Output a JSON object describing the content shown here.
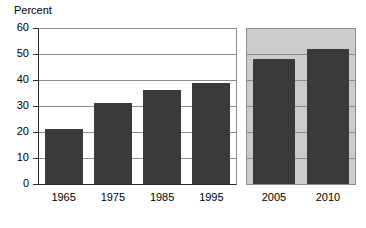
{
  "chart_data": {
    "type": "bar",
    "title": "",
    "xlabel": "",
    "ylabel": "Percent",
    "ylim": [
      0,
      60
    ],
    "yticks": [
      0,
      10,
      20,
      30,
      40,
      50,
      60
    ],
    "grid": true,
    "legend": null,
    "categories": [
      "1965",
      "1975",
      "1985",
      "1995",
      "2005",
      "2010"
    ],
    "values": [
      21,
      31,
      36,
      39,
      48,
      52
    ],
    "panels": [
      {
        "name": "historical-panel",
        "background": "#ffffff",
        "categories": [
          "1965",
          "1975",
          "1985",
          "1995"
        ],
        "values": [
          21,
          31,
          36,
          39
        ]
      },
      {
        "name": "recent-panel",
        "background": "#cccccc",
        "categories": [
          "2005",
          "2010"
        ],
        "values": [
          48,
          52
        ]
      }
    ],
    "colors": {
      "bar": "#3a3a3a",
      "grid": "#8c8c8c",
      "axis": "#2b2b2b",
      "panel_left_bg": "#ffffff",
      "panel_right_bg": "#cccccc",
      "text": "#000000"
    }
  },
  "axis": {
    "y_title": "Percent",
    "y_tick_labels": [
      "60",
      "50",
      "40",
      "30",
      "20",
      "10",
      "0"
    ],
    "x_tick_labels": [
      "1965",
      "1975",
      "1985",
      "1995",
      "2005",
      "2010"
    ]
  }
}
